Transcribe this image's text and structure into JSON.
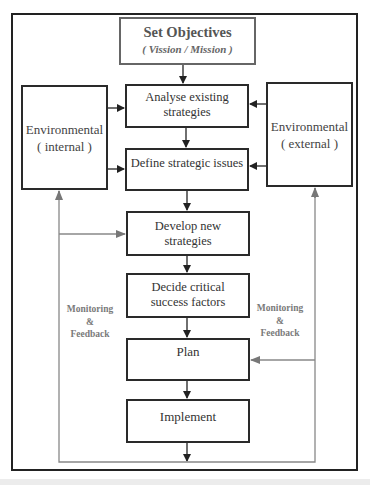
{
  "diagram": {
    "top": {
      "title": "Set Objectives",
      "subtitle": "( Vission / Mission )"
    },
    "environment_internal": {
      "line1": "Environmental",
      "line2": "( internal )"
    },
    "environment_external": {
      "line1": "Environmental",
      "line2": "( external )"
    },
    "steps": [
      {
        "line1": "Analyse existing",
        "line2": "strategies"
      },
      {
        "line1": "Define strategic issues",
        "line2": ""
      },
      {
        "line1": "Develop new",
        "line2": "strategies"
      },
      {
        "line1": "Decide critical",
        "line2": "success factors"
      },
      {
        "line1": "Plan",
        "line2": ""
      },
      {
        "line1": "Implement",
        "line2": ""
      }
    ],
    "feedback_left": {
      "line1": "Monitoring",
      "line2": "&",
      "line3": "Feedback"
    },
    "feedback_right": {
      "line1": "Monitoring",
      "line2": "&",
      "line3": "Feedback"
    },
    "colors": {
      "box_border": "#2a2a2a",
      "feedback_line": "#888888",
      "feedback_text": "#7a7a7a"
    }
  }
}
